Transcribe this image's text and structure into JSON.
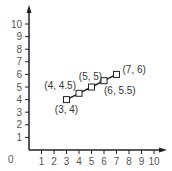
{
  "chart_data": {
    "type": "line",
    "title": "",
    "xlabel": "",
    "ylabel": "",
    "xlim": [
      0,
      10
    ],
    "ylim": [
      0,
      10
    ],
    "grid": false,
    "origin_label": "0",
    "x_ticks": [
      "1",
      "2",
      "3",
      "4",
      "5",
      "6",
      "7",
      "8",
      "9",
      "10"
    ],
    "y_ticks": [
      "1",
      "2",
      "3",
      "4",
      "5",
      "6",
      "7",
      "8",
      "9",
      "10"
    ],
    "series": [
      {
        "name": "points",
        "marker": "open-square",
        "points": [
          {
            "x": 3,
            "y": 4,
            "label": "(3, 4)"
          },
          {
            "x": 4,
            "y": 4.5,
            "label": "(4, 4.5)"
          },
          {
            "x": 5,
            "y": 5,
            "label": "(5, 5)"
          },
          {
            "x": 6,
            "y": 5.5,
            "label": "(6, 5.5)"
          },
          {
            "x": 7,
            "y": 6,
            "label": "(7, 6)"
          }
        ]
      }
    ],
    "colors": {
      "axis": "#222222",
      "line": "#222222",
      "text": "#555555"
    }
  }
}
